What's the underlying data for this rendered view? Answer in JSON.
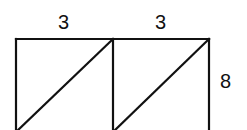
{
  "diagram": {
    "labels": {
      "top_left_width": "3",
      "top_right_width": "3",
      "right_height": "8"
    },
    "stroke_color": "#111111",
    "background_color": "#ffffff"
  }
}
